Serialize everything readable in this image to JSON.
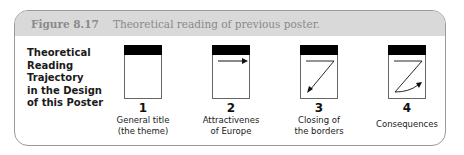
{
  "header": {
    "figure_number": "Figure 8.17",
    "caption": "Theoretical reading of previous poster."
  },
  "side_label": [
    "Theoretical",
    "Reading",
    "Trajectory",
    "in the Design",
    "of this Poster"
  ],
  "steps": [
    {
      "number": "1",
      "caption_lines": [
        "General title",
        "(the theme)"
      ],
      "icon": "blank-page-icon"
    },
    {
      "number": "2",
      "caption_lines": [
        "Attractivenes",
        "of Europe"
      ],
      "icon": "right-arrow-page-icon"
    },
    {
      "number": "3",
      "caption_lines": [
        "Closing of",
        "the borders"
      ],
      "icon": "diagonal-arrow-page-icon"
    },
    {
      "number": "4",
      "caption_lines": [
        "Consequences"
      ],
      "icon": "z-path-arrow-page-icon"
    }
  ],
  "colors": {
    "header_bg": "#d9d9d9",
    "header_text": "#8a8a8a",
    "bar": "#000000",
    "frame_border": "#9a9a9a"
  }
}
